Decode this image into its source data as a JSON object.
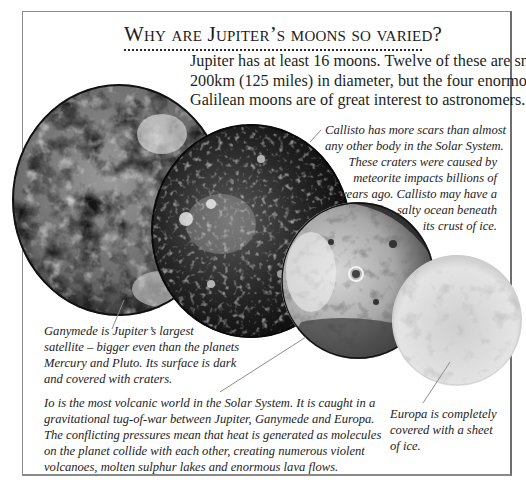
{
  "page": {
    "heading": "Why are Jupiter’s moons so varied?",
    "intro_lines": [
      "Jupiter has at least 16 moons. Twelve of these are smaller than",
      "200km (125 miles) in diameter, but the four enormous",
      "Galilean moons are of great interest to astronomers."
    ]
  },
  "moons": [
    {
      "name": "Ganymede",
      "caption_lines": [
        "Ganymede is Jupiter’s largest",
        "satellite – bigger even than the planets",
        "Mercury and Pluto. Its surface is dark",
        "and covered with craters."
      ]
    },
    {
      "name": "Callisto",
      "caption_lines": [
        "Callisto has more scars than almost",
        "any other body in the Solar System.",
        "These craters were caused by",
        "meteorite impacts billions of",
        "years ago. Callisto may have a",
        "salty ocean beneath",
        "its crust of ice."
      ]
    },
    {
      "name": "Io",
      "caption_lines": [
        "Io is the most volcanic world in the Solar System. It is caught in a",
        "gravitational tug-of-war between Jupiter, Ganymede and Europa.",
        "The conflicting pressures mean that heat is generated as molecules",
        "on the planet collide with each other, creating numerous violent",
        "volcanoes, molten sulphur lakes and enormous lava flows."
      ]
    },
    {
      "name": "Europa",
      "caption_lines": [
        "Europa is completely",
        "covered with a sheet",
        "of ice."
      ]
    }
  ],
  "colors": {
    "frame": "#8a8a8a",
    "text": "#231f20",
    "leader": "#8c8c8c"
  }
}
